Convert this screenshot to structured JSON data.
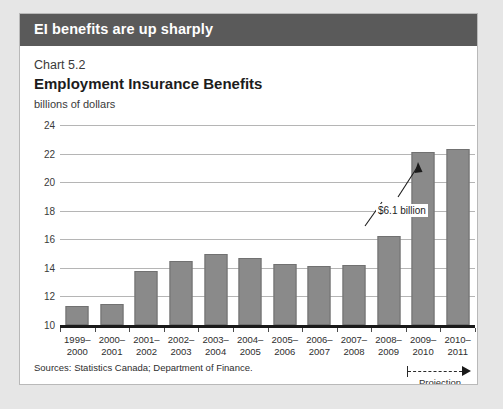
{
  "banner": {
    "title": "EI benefits are up sharply"
  },
  "source": {
    "text": "Sources: Statistics Canada; Department of Finance."
  },
  "projection": {
    "label": "Projection"
  },
  "chart_data": {
    "type": "bar",
    "chart_number": "Chart 5.2",
    "title": "Employment Insurance Benefits",
    "subtitle": "billions of dollars",
    "xlabel": "",
    "ylabel": "billions of dollars",
    "ylim": [
      10,
      24
    ],
    "ytick_step": 2,
    "yticks": [
      10,
      12,
      14,
      16,
      18,
      20,
      22,
      24
    ],
    "grid": true,
    "legend": "none",
    "bar_color": "#8a8a8a",
    "categories": [
      "1999–\n2000",
      "2000–\n2001",
      "2001–\n2002",
      "2002–\n2003",
      "2003–\n2004",
      "2004–\n2005",
      "2005–\n2006",
      "2006–\n2007",
      "2007–\n2008",
      "2008–\n2009",
      "2009–\n2010",
      "2010–\n2011"
    ],
    "category_lines": [
      [
        "1999–",
        "2000"
      ],
      [
        "2000–",
        "2001"
      ],
      [
        "2001–",
        "2002"
      ],
      [
        "2002–",
        "2003"
      ],
      [
        "2003–",
        "2004"
      ],
      [
        "2004–",
        "2005"
      ],
      [
        "2005–",
        "2006"
      ],
      [
        "2006–",
        "2007"
      ],
      [
        "2007–",
        "2008"
      ],
      [
        "2008–",
        "2009"
      ],
      [
        "2009–",
        "2010"
      ],
      [
        "2010–",
        "2011"
      ]
    ],
    "values": [
      11.3,
      11.5,
      13.8,
      14.5,
      15.0,
      14.7,
      14.3,
      14.1,
      14.2,
      16.2,
      22.1,
      22.3
    ],
    "annotations": [
      {
        "text": "$6.1 billion",
        "points_to_category": "2009–2010"
      }
    ],
    "projection_categories": [
      "2009–2010",
      "2010–2011"
    ]
  }
}
